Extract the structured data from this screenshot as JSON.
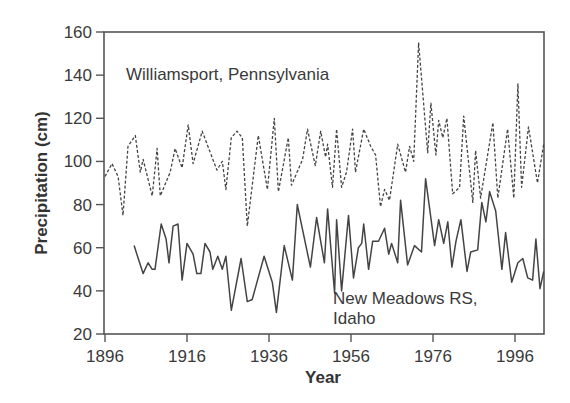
{
  "chart_data": {
    "type": "line",
    "title": "",
    "xlabel": "Year",
    "ylabel": "Precipitation (cm)",
    "xlim": [
      1896,
      2003
    ],
    "ylim": [
      20,
      160
    ],
    "x_ticks": [
      1896,
      1916,
      1936,
      1956,
      1976,
      1996
    ],
    "y_ticks": [
      20,
      40,
      60,
      80,
      100,
      120,
      140,
      160
    ],
    "grid": false,
    "legend": "none (inline annotations)",
    "annotations": [
      {
        "text": "Williamsport, Pennsylvania",
        "series": "Williamsport, Pennsylvania"
      },
      {
        "text": "New Meadows RS,",
        "series": "New Meadows RS, Idaho"
      },
      {
        "text": "Idaho",
        "series": "New Meadows RS, Idaho"
      }
    ],
    "series": [
      {
        "name": "Williamsport, Pennsylvania",
        "style": "dashed",
        "color": "#444444",
        "points": [
          [
            1896,
            93
          ],
          [
            1897.7,
            99
          ],
          [
            1899.2,
            93
          ],
          [
            1900.4,
            75
          ],
          [
            1901.6,
            107
          ],
          [
            1903.4,
            112
          ],
          [
            1904.6,
            95
          ],
          [
            1905.3,
            101
          ],
          [
            1907.5,
            84
          ],
          [
            1908.7,
            106
          ],
          [
            1909.5,
            84
          ],
          [
            1911.9,
            95
          ],
          [
            1913.1,
            106
          ],
          [
            1914.8,
            97
          ],
          [
            1916.3,
            117
          ],
          [
            1917.5,
            99
          ],
          [
            1919.7,
            114
          ],
          [
            1923.3,
            96
          ],
          [
            1924.6,
            100
          ],
          [
            1925.5,
            87
          ],
          [
            1926.8,
            111
          ],
          [
            1928.2,
            114
          ],
          [
            1929.5,
            111
          ],
          [
            1930.7,
            70
          ],
          [
            1933.4,
            112
          ],
          [
            1935.6,
            87
          ],
          [
            1937.3,
            120
          ],
          [
            1938.3,
            86
          ],
          [
            1940.7,
            111
          ],
          [
            1941.5,
            89
          ],
          [
            1944.2,
            101
          ],
          [
            1945.4,
            115
          ],
          [
            1947.3,
            98
          ],
          [
            1948.6,
            114
          ],
          [
            1949.8,
            102
          ],
          [
            1950.3,
            108
          ],
          [
            1951.5,
            88
          ],
          [
            1952.5,
            115
          ],
          [
            1953.7,
            88
          ],
          [
            1954.9,
            95
          ],
          [
            1956.4,
            115
          ],
          [
            1957.1,
            95
          ],
          [
            1959.1,
            115
          ],
          [
            1960.8,
            107
          ],
          [
            1962.0,
            103
          ],
          [
            1963.2,
            79
          ],
          [
            1964.2,
            87
          ],
          [
            1965.4,
            82
          ],
          [
            1967.4,
            108
          ],
          [
            1969.3,
            95
          ],
          [
            1970.3,
            107
          ],
          [
            1971.3,
            100
          ],
          [
            1972.5,
            155
          ],
          [
            1974.7,
            104
          ],
          [
            1975.5,
            127
          ],
          [
            1976.7,
            103
          ],
          [
            1977.4,
            119
          ],
          [
            1978.4,
            111
          ],
          [
            1979.4,
            120
          ],
          [
            1980.8,
            85
          ],
          [
            1982.5,
            88
          ],
          [
            1983.5,
            121
          ],
          [
            1985.7,
            81
          ],
          [
            1986.4,
            105
          ],
          [
            1987.6,
            83
          ],
          [
            1990.6,
            118
          ],
          [
            1991.8,
            83
          ],
          [
            1994.2,
            115
          ],
          [
            1995.7,
            83
          ],
          [
            1996.7,
            136
          ],
          [
            1997.6,
            88
          ],
          [
            1999.3,
            116
          ],
          [
            2001.5,
            90
          ],
          [
            2003,
            108
          ]
        ]
      },
      {
        "name": "New Meadows RS, Idaho",
        "style": "solid",
        "color": "#444444",
        "points": [
          [
            1903.1,
            61
          ],
          [
            1905.3,
            48
          ],
          [
            1906.5,
            53
          ],
          [
            1907.5,
            50
          ],
          [
            1908.2,
            50
          ],
          [
            1909.7,
            71
          ],
          [
            1910.9,
            64
          ],
          [
            1911.6,
            53
          ],
          [
            1912.6,
            70
          ],
          [
            1913.8,
            71
          ],
          [
            1914.8,
            45
          ],
          [
            1916.0,
            62
          ],
          [
            1917.5,
            57
          ],
          [
            1918.4,
            48
          ],
          [
            1919.4,
            48
          ],
          [
            1920.4,
            62
          ],
          [
            1921.6,
            58
          ],
          [
            1922.3,
            50
          ],
          [
            1923.5,
            56
          ],
          [
            1924.6,
            50
          ],
          [
            1925.5,
            56
          ],
          [
            1926.8,
            31
          ],
          [
            1929.2,
            55
          ],
          [
            1930.7,
            35
          ],
          [
            1931.9,
            36
          ],
          [
            1934.8,
            56
          ],
          [
            1936.8,
            44
          ],
          [
            1937.8,
            30
          ],
          [
            1939.7,
            61
          ],
          [
            1941.7,
            45
          ],
          [
            1942.9,
            80
          ],
          [
            1946.1,
            51
          ],
          [
            1947.6,
            74
          ],
          [
            1949.5,
            53
          ],
          [
            1950.3,
            78
          ],
          [
            1952.0,
            39
          ],
          [
            1952.5,
            73
          ],
          [
            1953.7,
            40
          ],
          [
            1955.4,
            75
          ],
          [
            1956.6,
            46
          ],
          [
            1957.8,
            60
          ],
          [
            1958.6,
            62
          ],
          [
            1959.1,
            71
          ],
          [
            1960.3,
            50
          ],
          [
            1961.3,
            63
          ],
          [
            1962.7,
            63
          ],
          [
            1964.2,
            69
          ],
          [
            1965.2,
            57
          ],
          [
            1965.9,
            62
          ],
          [
            1967.4,
            53
          ],
          [
            1968.1,
            82
          ],
          [
            1969.8,
            52
          ],
          [
            1971.5,
            61
          ],
          [
            1973.2,
            58
          ],
          [
            1974.2,
            92
          ],
          [
            1976.4,
            61
          ],
          [
            1977.4,
            73
          ],
          [
            1978.6,
            62
          ],
          [
            1979.6,
            72
          ],
          [
            1980.6,
            51
          ],
          [
            1981.6,
            63
          ],
          [
            1982.8,
            73
          ],
          [
            1984.3,
            49
          ],
          [
            1985.2,
            58
          ],
          [
            1986.9,
            59
          ],
          [
            1987.9,
            81
          ],
          [
            1988.9,
            72
          ],
          [
            1989.8,
            86
          ],
          [
            1991.3,
            77
          ],
          [
            1992.8,
            50
          ],
          [
            1993.7,
            67
          ],
          [
            1995.2,
            44
          ],
          [
            1996.7,
            53
          ],
          [
            1997.9,
            55
          ],
          [
            1999.1,
            46
          ],
          [
            2000.3,
            45
          ],
          [
            2001.1,
            64
          ],
          [
            2002.1,
            41
          ],
          [
            2003,
            49
          ]
        ]
      }
    ]
  },
  "labels": {
    "y_axis_title": "Precipitation (cm)",
    "x_axis_title": "Year",
    "annot_williamsport": "Williamsport, Pennsylvania",
    "annot_newmeadows_1": "New Meadows RS,",
    "annot_newmeadows_2": "Idaho"
  }
}
